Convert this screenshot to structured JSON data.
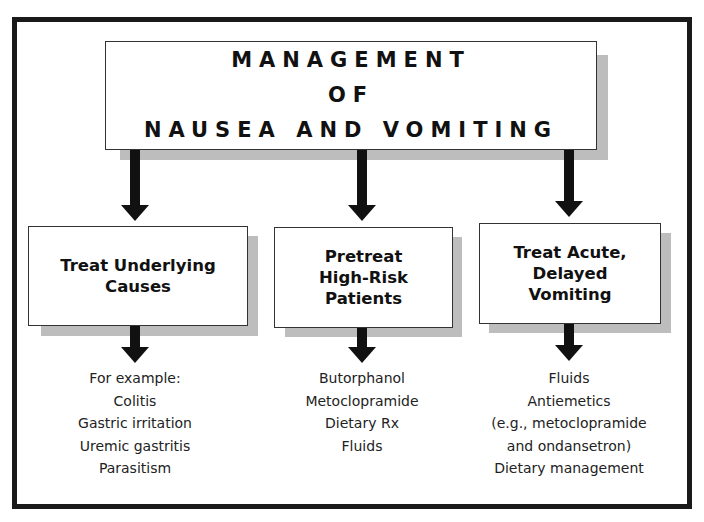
{
  "title": {
    "lines": [
      "MANAGEMENT",
      "OF",
      "NAUSEA AND VOMITING"
    ]
  },
  "branches": [
    {
      "heading_lines": [
        "Treat Underlying",
        "Causes"
      ],
      "items": [
        "For example:",
        "Colitis",
        "Gastric irritation",
        "Uremic gastritis",
        "Parasitism"
      ]
    },
    {
      "heading_lines": [
        "Pretreat",
        "High-Risk",
        "Patients"
      ],
      "items": [
        "Butorphanol",
        "Metoclopramide",
        "Dietary Rx",
        "Fluids"
      ]
    },
    {
      "heading_lines": [
        "Treat Acute,",
        "Delayed",
        "Vomiting"
      ],
      "items": [
        "Fluids",
        "Antiemetics",
        "(e.g., metoclopramide",
        "and ondansetron)",
        "Dietary management"
      ]
    }
  ],
  "colors": {
    "border": "#1a1a1a",
    "shadow": "#bdbdbd",
    "arrow": "#111111"
  }
}
